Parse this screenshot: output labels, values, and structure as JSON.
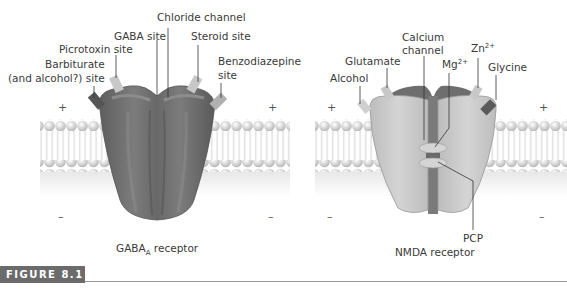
{
  "figure": {
    "label": "FIGURE 8.1",
    "badge_color": "#6b6b6b"
  },
  "gaba_receptor": {
    "caption_main": "GABA",
    "caption_sub": "A",
    "caption_rest": " receptor",
    "labels": {
      "chloride_channel": "Chloride channel",
      "gaba_site": "GABA site",
      "steroid_site": "Steroid site",
      "picrotoxin_site": "Picrotoxin site",
      "barbiturate_line1": "Barbiturate",
      "barbiturate_line2": "(and alcohol?) site",
      "benzodiazepine_line1": "Benzodiazepine",
      "benzodiazepine_line2": "site"
    },
    "signs": {
      "outside": "+",
      "inside": "–"
    }
  },
  "nmda_receptor": {
    "caption": "NMDA receptor",
    "labels": {
      "calcium_line1": "Calcium",
      "calcium_line2": "channel",
      "glutamate": "Glutamate",
      "alcohol": "Alcohol",
      "mg": "Mg",
      "mg_sup": "2+",
      "zn": "Zn",
      "zn_sup": "2+",
      "glycine": "Glycine",
      "pcp": "PCP"
    },
    "signs": {
      "outside": "+",
      "inside": "–"
    }
  },
  "colors": {
    "receptor_dark": "#6e6e6e",
    "receptor_light": "#c8c8c8",
    "membrane_head": "#d8d8d8",
    "label_text": "#3a3a3a"
  }
}
